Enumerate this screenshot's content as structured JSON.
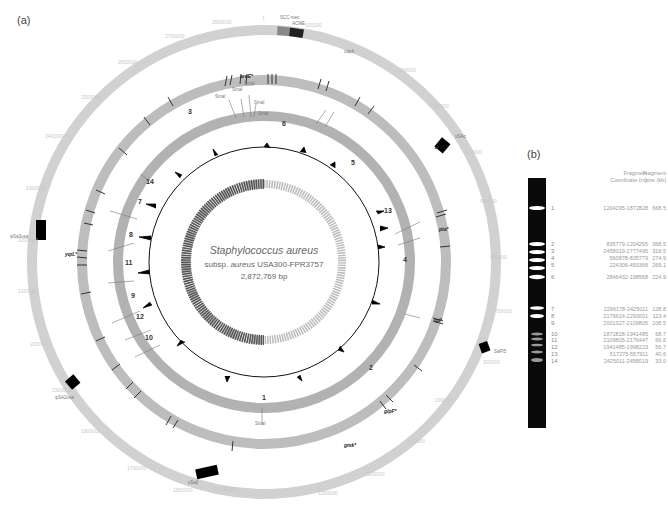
{
  "panel_a": {
    "label": "(a)",
    "title_species": "Staphylococcus aureus",
    "title_subsp_prefix": "subsp.",
    "title_subsp_italic": "aureus",
    "title_strain": "USA300-FPR3757",
    "genome_size": "2,872,769 bp",
    "outer_ring_ticks": [
      "1",
      "100000",
      "200000",
      "300000",
      "400000",
      "500000",
      "600000",
      "700000",
      "800000",
      "900000",
      "1000000",
      "1100000",
      "1200000",
      "1300000",
      "1400000",
      "1500000",
      "1600000",
      "1700000",
      "1800000",
      "1900000",
      "2000000",
      "2100000",
      "2200000",
      "2300000",
      "2400000",
      "2500000",
      "2600000",
      "2700000",
      "2800000"
    ],
    "outer_ring_features": [
      {
        "label": "SCC mec",
        "type": "grey"
      },
      {
        "label": "ACME",
        "type": "black"
      },
      {
        "label": "capA",
        "type": "gene"
      },
      {
        "label": "νSAα",
        "type": "black"
      },
      {
        "label": "SaPI5",
        "type": "black"
      },
      {
        "label": "φSa3usa",
        "type": "black"
      },
      {
        "label": "νSaβ",
        "type": "black"
      },
      {
        "label": "φSA2usa",
        "type": "black"
      }
    ],
    "middle_ring_genes_bold": [
      "arcC*",
      "pta*",
      "tpi*",
      "glpF*",
      "gmk*",
      "aroE*",
      "yqiL*"
    ],
    "restriction_enzyme": "SmaI",
    "fragment_ring_labels": [
      "1",
      "2",
      "3",
      "4",
      "5",
      "6",
      "7",
      "8",
      "9",
      "10",
      "11",
      "12",
      "13",
      "14"
    ]
  },
  "panel_b": {
    "label": "(b)",
    "col_coord_header": [
      "Fragment",
      "Coordinate (nt)"
    ],
    "col_size_header": [
      "Fragment",
      "size (kb)"
    ],
    "fragments": [
      {
        "num": "1",
        "coords": "1204295-1872828",
        "size": "668.5"
      },
      {
        "num": "2",
        "coords": "835779-1204295",
        "size": "368.5"
      },
      {
        "num": "3",
        "coords": "2458019-2777495",
        "size": "319.5"
      },
      {
        "num": "4",
        "coords": "560878-835779",
        "size": "274.9"
      },
      {
        "num": "5",
        "coords": "224306-493368",
        "size": "269.1"
      },
      {
        "num": "6",
        "coords": "2846432-198568",
        "size": "224.9"
      },
      {
        "num": "7",
        "coords": "2296178-2425011",
        "size": "128.8"
      },
      {
        "num": "8",
        "coords": "2179624-2293001",
        "size": "113.4"
      },
      {
        "num": "9",
        "coords": "2001327-2109805",
        "size": "108.5"
      },
      {
        "num": "10",
        "coords": "1872828-1941485",
        "size": "68.7"
      },
      {
        "num": "11",
        "coords": "2109805-2176447",
        "size": "66.6"
      },
      {
        "num": "12",
        "coords": "1941485-1998223",
        "size": "56.7"
      },
      {
        "num": "13",
        "coords": "517275-557911",
        "size": "40.6"
      },
      {
        "num": "14",
        "coords": "2425011-2458019",
        "size": "33.0"
      }
    ]
  },
  "chart_data": {
    "type": "circular-genome-map",
    "title": "Staphylococcus aureus subsp. aureus USA300-FPR3757",
    "genome_length_bp": 2872769,
    "tracks": [
      "coordinate ring with mobile genetic elements",
      "gene / MLST loci ring",
      "SmaI fragment ring (1-14)",
      "GC skew (black)",
      "GC content (grey)"
    ],
    "gel": {
      "fragment_sizes_kb": [
        668.5,
        368.5,
        319.5,
        274.9,
        269.1,
        224.9,
        128.8,
        113.4,
        108.5,
        68.7,
        66.6,
        56.7,
        40.6,
        33.0
      ]
    }
  }
}
